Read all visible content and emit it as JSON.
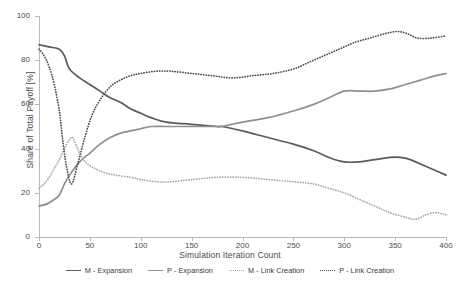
{
  "chart_data": {
    "type": "line",
    "title": "",
    "xlabel": "Simulation Iteration Count",
    "ylabel": "Share of Total Payoff [%]",
    "xlim": [
      0,
      400
    ],
    "ylim": [
      0,
      100
    ],
    "xticks": [
      0,
      50,
      100,
      150,
      200,
      250,
      300,
      350,
      400
    ],
    "yticks": [
      0,
      20,
      40,
      60,
      80,
      100
    ],
    "grid": false,
    "legend_position": "bottom",
    "series": [
      {
        "name": "M - Expansion",
        "style": "solid",
        "color": "#5b5b5b",
        "x": [
          0,
          10,
          20,
          25,
          30,
          40,
          50,
          60,
          70,
          80,
          90,
          100,
          110,
          125,
          150,
          175,
          180,
          200,
          225,
          250,
          270,
          285,
          300,
          315,
          330,
          345,
          355,
          365,
          380,
          390,
          400
        ],
        "values": [
          87,
          86,
          85,
          82,
          76,
          72,
          69,
          66,
          63,
          61,
          58,
          56,
          54,
          52,
          51,
          50,
          50,
          48,
          45,
          42,
          39,
          36,
          34,
          34,
          35,
          36,
          36,
          35,
          32,
          30,
          28
        ]
      },
      {
        "name": "P - Expansion",
        "style": "solid",
        "color": "#909090",
        "x": [
          0,
          8,
          15,
          20,
          25,
          30,
          40,
          50,
          60,
          70,
          80,
          90,
          100,
          110,
          125,
          150,
          175,
          180,
          200,
          225,
          250,
          270,
          285,
          300,
          315,
          330,
          345,
          360,
          375,
          390,
          400
        ],
        "values": [
          14,
          15,
          17,
          19,
          24,
          28,
          34,
          38,
          42,
          45,
          47,
          48,
          49,
          50,
          50,
          50,
          50,
          50,
          52,
          54,
          57,
          60,
          63,
          66,
          66,
          66,
          67,
          69,
          71,
          73,
          74
        ]
      },
      {
        "name": "M - Link Creation",
        "style": "dotted",
        "color": "#a8a8a8",
        "x": [
          0,
          5,
          10,
          15,
          20,
          25,
          30,
          33,
          38,
          42,
          48,
          55,
          65,
          75,
          90,
          100,
          115,
          130,
          150,
          175,
          200,
          225,
          250,
          270,
          285,
          300,
          315,
          330,
          345,
          360,
          370,
          380,
          390,
          400
        ],
        "values": [
          22,
          24,
          27,
          31,
          35,
          40,
          44,
          45,
          40,
          36,
          33,
          31,
          29,
          28,
          27,
          26,
          25,
          25,
          26,
          27,
          27,
          26,
          25,
          24,
          22,
          20,
          17,
          14,
          11,
          9,
          8,
          10,
          11,
          10
        ]
      },
      {
        "name": "P - Link Creation",
        "style": "dotted",
        "color": "#4a4a4a",
        "x": [
          0,
          5,
          10,
          15,
          20,
          23,
          27,
          32,
          38,
          45,
          52,
          60,
          70,
          80,
          90,
          100,
          115,
          130,
          150,
          170,
          190,
          210,
          230,
          250,
          265,
          280,
          295,
          310,
          325,
          340,
          352,
          362,
          372,
          385,
          400
        ],
        "values": [
          85,
          82,
          77,
          69,
          57,
          45,
          32,
          24,
          33,
          45,
          55,
          62,
          68,
          71,
          73,
          74,
          75,
          75,
          74,
          73,
          72,
          73,
          74,
          76,
          79,
          82,
          85,
          88,
          90,
          92,
          93,
          92,
          90,
          90,
          91
        ]
      }
    ]
  },
  "legend": {
    "items": [
      {
        "label": "M - Expansion",
        "style": "solid",
        "color": "#5b5b5b"
      },
      {
        "label": "P - Expansion",
        "style": "solid",
        "color": "#909090"
      },
      {
        "label": "M - Link Creation",
        "style": "dotted",
        "color": "#a8a8a8"
      },
      {
        "label": "P - Link Creation",
        "style": "dotted",
        "color": "#4a4a4a"
      }
    ]
  },
  "axes": {
    "y_title": "Share of Total Payoff [%]",
    "x_title": "Simulation Iteration Count",
    "y_tick_labels": [
      "0",
      "20",
      "40",
      "60",
      "80",
      "100"
    ],
    "x_tick_labels": [
      "0",
      "50",
      "100",
      "150",
      "200",
      "250",
      "300",
      "350",
      "400"
    ]
  }
}
